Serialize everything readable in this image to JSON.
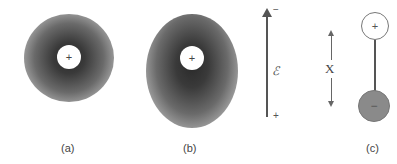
{
  "panels": {
    "a": {
      "label": "(a)",
      "description": "Spherical electron cloud centered on nucleus",
      "nucleus_sign": "+"
    },
    "b": {
      "label": "(b)",
      "description": "Electron cloud distorted by external field; nucleus displaced upward",
      "nucleus_sign": "+"
    },
    "field": {
      "symbol": "ℰ",
      "top_sign": "−",
      "bottom_sign": "+"
    },
    "c": {
      "label": "(c)",
      "separation_label": "X",
      "positive_sign": "+",
      "negative_sign": "−"
    }
  },
  "colors": {
    "cloud_core": "#2a2a2a",
    "line": "#555555",
    "negative_charge_fill": "#8a8a8a"
  }
}
